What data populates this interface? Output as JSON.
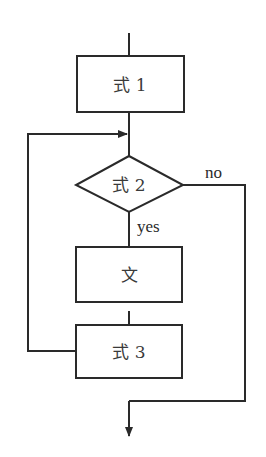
{
  "diagram": {
    "type": "flowchart",
    "nodes": {
      "expr1": {
        "label": "式 1",
        "shape": "process"
      },
      "expr2": {
        "label": "式 2",
        "shape": "decision"
      },
      "stmt": {
        "label": "文",
        "shape": "process"
      },
      "expr3": {
        "label": "式 3",
        "shape": "process"
      }
    },
    "edges": {
      "yes_label": "yes",
      "no_label": "no"
    },
    "colors": {
      "stroke": "#2a2a2a",
      "text": "#3a3a3a",
      "background": "#ffffff"
    }
  }
}
